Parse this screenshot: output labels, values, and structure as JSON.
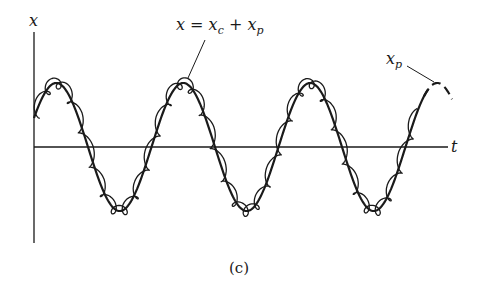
{
  "figure": {
    "caption": "(c)",
    "axes": {
      "y_label": "x",
      "x_label": "t"
    },
    "annotations": {
      "total": {
        "lhs": "x",
        "eq": " = ",
        "term1_base": "x",
        "term1_sub": "c",
        "plus": " + ",
        "term2_base": "x",
        "term2_sub": "p"
      },
      "particular": {
        "base": "x",
        "sub": "p"
      }
    },
    "colors": {
      "ink": "#1a1a1a",
      "background": "#ffffff"
    }
  }
}
